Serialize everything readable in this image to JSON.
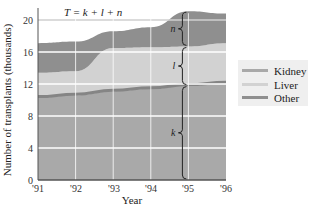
{
  "chart_data": {
    "type": "area",
    "stacked": true,
    "title": "",
    "annotation": "T = k + l + n",
    "xlabel": "Year",
    "ylabel": "Number of transplants (thousands)",
    "x": [
      "'91",
      "'92",
      "'93",
      "'94",
      "'95",
      "'96"
    ],
    "xticks": [
      "'91",
      "'92",
      "'93",
      "'94",
      "'95",
      "'96"
    ],
    "yticks": [
      0,
      4,
      8,
      12,
      16,
      20
    ],
    "ylim": [
      0,
      22
    ],
    "grid": true,
    "legend_position": "right",
    "series": [
      {
        "name": "Kidney",
        "symbol": "k",
        "values": [
          10.3,
          10.6,
          11.1,
          11.4,
          11.8,
          12.1
        ],
        "color": "#a9a9a9"
      },
      {
        "name": "Liver",
        "symbol": "l",
        "values": [
          3.1,
          3.0,
          5.4,
          5.2,
          4.9,
          5.0
        ],
        "color": "#d2d2d2"
      },
      {
        "name": "Other",
        "symbol": "n",
        "values": [
          3.7,
          3.7,
          2.1,
          2.5,
          4.4,
          3.7
        ],
        "color": "#8f8f8f"
      }
    ],
    "total_T": [
      17.1,
      17.3,
      18.6,
      19.1,
      21.1,
      20.8
    ],
    "brace_annotations": [
      {
        "label": "n",
        "at": "'95"
      },
      {
        "label": "l",
        "at": "'95"
      },
      {
        "label": "k",
        "at": "'95"
      }
    ]
  },
  "legend": {
    "items": [
      {
        "label": "Kidney",
        "color": "#a9a9a9"
      },
      {
        "label": "Liver",
        "color": "#d2d2d2"
      },
      {
        "label": "Other",
        "color": "#8f8f8f"
      }
    ]
  },
  "labels": {
    "formula": "T = k + l + n",
    "xlabel": "Year",
    "ylabel": "Number of transplants (thousands)",
    "brace_n": "n",
    "brace_l": "l",
    "brace_k": "k",
    "y0": "0",
    "y4": "4",
    "y8": "8",
    "y12": "12",
    "y16": "16",
    "y20": "20",
    "x91": "'91",
    "x92": "'92",
    "x93": "'93",
    "x94": "'94",
    "x95": "'95",
    "x96": "'96"
  }
}
